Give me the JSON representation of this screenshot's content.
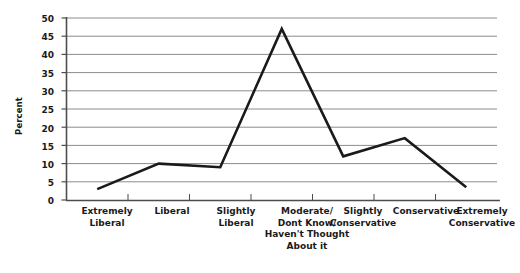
{
  "chart_data": {
    "type": "line",
    "title": "",
    "subtitle": "",
    "xlabel": "",
    "ylabel": "Percent",
    "ylim": [
      0,
      50
    ],
    "yticks": [
      0,
      5,
      10,
      15,
      20,
      25,
      30,
      35,
      40,
      45,
      50
    ],
    "grid": true,
    "legend": false,
    "legend_position": "none",
    "line_color": "#1a1a1a",
    "grid_color": "#8c8c8c",
    "axis_color": "#4d4d4d",
    "categories": [
      "Extremely\nLiberal",
      "Liberal",
      "Slightly\nLiberal",
      "Moderate/\nDont Know/\nHaven't Thought\nAbout it",
      "Slightly\nConservative",
      "Conservative",
      "Extremely\nConservative"
    ],
    "values": [
      3,
      10,
      9,
      47,
      12,
      17,
      3.5
    ],
    "series": [
      {
        "name": "Percent",
        "values": [
          3,
          10,
          9,
          47,
          12,
          17,
          3.5
        ]
      }
    ]
  },
  "axis": {
    "y_label": "Percent",
    "y_ticks": [
      "0",
      "5",
      "10",
      "15",
      "20",
      "25",
      "30",
      "35",
      "40",
      "45",
      "50"
    ],
    "x_categories": [
      "Extremely\nLiberal",
      "Liberal",
      "Slightly\nLiberal",
      "Moderate/\nDont Know/\nHaven't Thought\nAbout it",
      "Slightly\nConservative",
      "Conservative",
      "Extremely\nConservative"
    ]
  }
}
